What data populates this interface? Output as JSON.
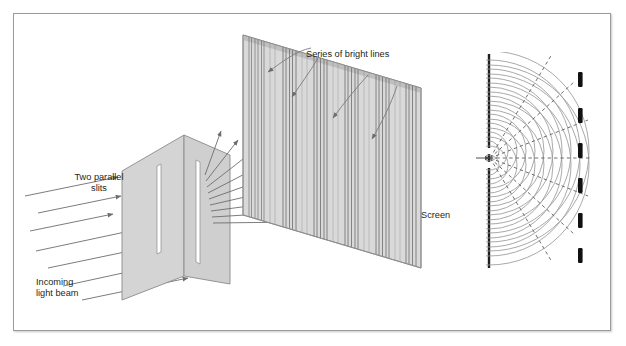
{
  "figure": {
    "background_color": "#ffffff",
    "frame_border_color": "#9b9b9b",
    "ink_color": "#231f20",
    "panel_fill": "#d7d7d7",
    "panel_edge": "#8c8c8c",
    "arrow_color": "#6d6d6d",
    "wave_color": "#8d8d8d",
    "dashed_color": "#6a6a6a",
    "fringe_color": "#111111"
  },
  "labels": {
    "two_parallel_slits": "Two parallel\nslits",
    "incoming_light_beam": "Incoming\nlight beam",
    "series_of_bright_lines": "Series of bright lines",
    "screen": "Screen"
  },
  "diagram_data": {
    "type": "diagram",
    "slit_plate": {
      "name": "two-slit-plate",
      "slit_count": 2,
      "slit_fill": "#ffffff"
    },
    "incoming_beam": {
      "name": "incoming-light-beam",
      "ray_count": 6,
      "direction": "up-right"
    },
    "diffracted_beam": {
      "name": "diffracted-rays",
      "ray_count": 9,
      "direction": "fanning right"
    },
    "screen_panel": {
      "name": "projection-screen",
      "band_groups": 6,
      "callout_arrows": 4
    },
    "wave_inset": {
      "name": "wavefront-interference-inset",
      "barrier_slits": 2,
      "wavefront_arcs_per_slit": 11,
      "nodal_dashed_lines": 7,
      "fringe_marks": 6
    }
  }
}
